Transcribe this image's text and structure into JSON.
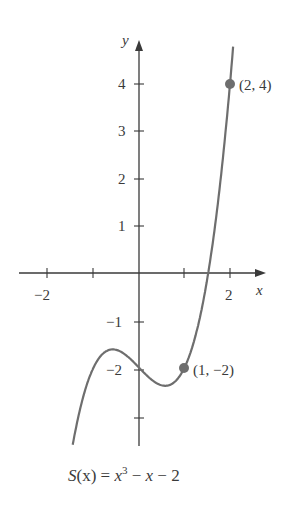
{
  "chart_data": {
    "type": "line",
    "function": "x^3 - x - 2",
    "xlabel": "x",
    "ylabel": "y",
    "xlim": [
      -2.6,
      2.8
    ],
    "ylim": [
      -3.7,
      5.0
    ],
    "x_ticks": [
      -2,
      -1,
      0,
      1,
      2
    ],
    "x_tick_labels": [
      "-2",
      "2"
    ],
    "y_ticks": [
      4,
      3,
      2,
      1,
      -1,
      -2,
      -3
    ],
    "y_tick_labels": [
      "4",
      "3",
      "2",
      "1",
      "-1",
      "-2"
    ],
    "grid": false,
    "curve_domain": [
      -1.55,
      2.2
    ],
    "series": [
      {
        "name": "S(x)",
        "x": [
          -1.55,
          -1.0,
          -0.577,
          0,
          0.577,
          1,
          1.5,
          2,
          2.2
        ],
        "y": [
          -4.17,
          -2.0,
          -1.615,
          -2.0,
          -2.385,
          -2.0,
          -0.125,
          4.0,
          6.45
        ]
      }
    ],
    "annotations": [
      {
        "point": [
          1,
          -2
        ],
        "label": "(1, −2)"
      },
      {
        "point": [
          2,
          4
        ],
        "label": "(2, 4)"
      }
    ],
    "colors": {
      "curve": "#6e6e6e",
      "axis": "#3a3a3a",
      "point": "#6e6e6e"
    }
  },
  "labels": {
    "x_axis": "x",
    "y_axis": "y",
    "x_neg2": "−2",
    "x_pos2": "2",
    "y4": "4",
    "y3": "3",
    "y2": "2",
    "y1": "1",
    "ym1": "−1",
    "ym2": "−2",
    "pt1": "(1, −2)",
    "pt2": "(2, 4)"
  },
  "caption": {
    "S": "S",
    "paren_open": "(x) = ",
    "x": "x",
    "exp": "3",
    "rest": " − ",
    "x2": "x",
    "rest2": " − 2"
  }
}
